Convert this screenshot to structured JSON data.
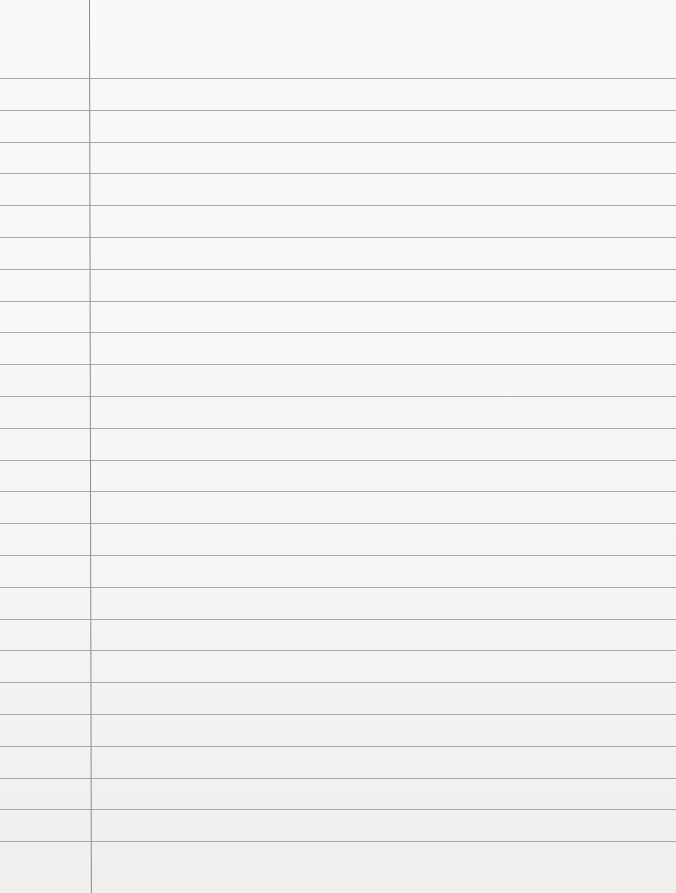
{
  "page": {
    "type": "blank-lined-paper",
    "background_color": "#f7f7f6",
    "rule_color": "#9a9a9a",
    "margin_line_color": "#8c8c8c",
    "margin_line_x": 89,
    "first_rule_y": 78,
    "rule_spacing": 31.8,
    "rule_count": 25,
    "text": ""
  }
}
